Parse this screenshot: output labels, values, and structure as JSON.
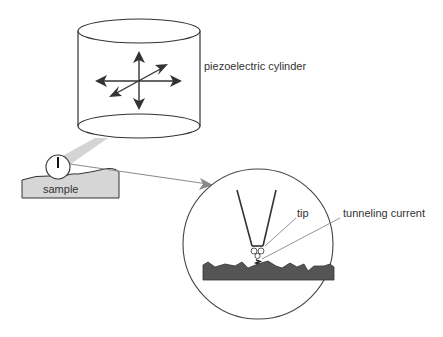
{
  "diagram": {
    "labels": {
      "cylinder": "piezoelectric cylinder",
      "sample": "sample",
      "tip": "tip",
      "current": "tunneling current"
    },
    "colors": {
      "stroke": "#333333",
      "arm": "#d4d4d4",
      "sample_fill": "#d6d6d6",
      "surface_fill": "#555555",
      "pointer": "#8a8a8a"
    }
  }
}
